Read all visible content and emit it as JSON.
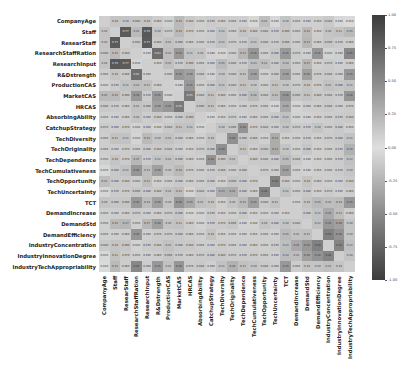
{
  "chart_data": {
    "type": "heatmap",
    "title": "",
    "xlabel": "",
    "ylabel": "",
    "labels": [
      "CompanyAge",
      "Staff",
      "ResearStaff",
      "ResearchStaffRation",
      "ResearchInput",
      "R&Dstrength",
      "ProductionCAS",
      "MarketCAS",
      "HRCAS",
      "AbsorbingAbility",
      "CatchupStrategy",
      "TechDiversity",
      "TechOriginality",
      "TechDependence",
      "TechCumulativeness",
      "TechOpportunity",
      "TechUncertainty",
      "TCT",
      "DemandIncrease",
      "DemandStd",
      "DemandEfficiency",
      "IndustryConcentration",
      "IndustryInnovationDegree",
      "IndustryTechAppropriability"
    ],
    "row_labels": [
      "CompanyAge",
      "Staff",
      "ResearStaff",
      "ResearchStaffRation",
      "ResearchInput",
      "R&Dstrength",
      "ProductionCAS",
      "MarketCAS",
      "HRCAS",
      "AbsorbingAbility",
      "CatchupStrategy",
      "TechDiversity",
      "TechOriginality",
      "TechDependence",
      "TechCumulativeness",
      "TechOpportunity",
      "TechUncertainty",
      "TCT",
      "DemandIncrease",
      "DemandStd",
      "DemandEfficiency",
      "IndustryConcentration",
      "IndustryInnovationDegree",
      "IndustryTechAppropriability"
    ],
    "col_labels": [
      "CompanyAge",
      "Staff",
      "ResearStaff",
      "ResearchStaffRation",
      "ResearchInput",
      "R&Dstrength",
      "ProductionCAS",
      "MarketCAS",
      "HRCAS",
      "AbsorbingAbility",
      "CatchupStrategy",
      "TechDiversity",
      "TechOriginality",
      "TechDependence",
      "TechCumulativeness",
      "TechOpportunity",
      "TechUncertainty",
      "TCT",
      "DemandIncrease",
      "DemandStd",
      "DemandEfficiency",
      "IndustryConcentration",
      "IndustryInnovationDegree",
      "IndustryTechAppropriability"
    ],
    "colorbar": {
      "min": -1.0,
      "max": 1.0,
      "ticks": [
        "1.00",
        "0.75",
        "0.50",
        "0.25",
        "0.00",
        "-0.25",
        "-0.50",
        "-0.75",
        "-1.00"
      ]
    },
    "annotated": true,
    "diagonal_masked": true,
    "values": [
      [
        1.0,
        0.1,
        0.1,
        0.09,
        0.1,
        0.06,
        0.04,
        0.15,
        0.08,
        0.05,
        0.07,
        0.06,
        0.06,
        0.05,
        0.02,
        0.13,
        0.02,
        0.1,
        0.05,
        0.05,
        0.05,
        0.08,
        0.02,
        0.01
      ],
      [
        0.1,
        1.0,
        0.77,
        0.15,
        0.79,
        0.1,
        0.07,
        0.15,
        0.07,
        0.05,
        0.06,
        0.11,
        0.06,
        0.1,
        0.08,
        0.08,
        0.07,
        0.09,
        0.06,
        0.15,
        0.05,
        0.1,
        0.11,
        0.15
      ],
      [
        0.1,
        0.77,
        1.0,
        0.08,
        0.77,
        0.08,
        0.11,
        0.09,
        0.06,
        0.06,
        0.07,
        0.11,
        0.07,
        0.07,
        0.11,
        0.08,
        0.07,
        0.09,
        0.06,
        0.17,
        0.06,
        0.09,
        0.07,
        0.06
      ],
      [
        0.09,
        0.15,
        0.08,
        1.0,
        0.03,
        0.63,
        0.13,
        0.35,
        0.11,
        0.1,
        0.04,
        0.03,
        0.06,
        0.17,
        0.36,
        0.06,
        0.09,
        0.35,
        0.07,
        0.05,
        0.36,
        0.04,
        0.05,
        0.45
      ],
      [
        0.1,
        0.79,
        0.77,
        0.03,
        1.0,
        0.05,
        0.12,
        0.07,
        0.09,
        0.06,
        0.06,
        0.15,
        0.08,
        0.07,
        0.13,
        0.13,
        0.08,
        0.14,
        0.06,
        0.17,
        0.05,
        0.07,
        0.05,
        0.06
      ],
      [
        0.06,
        0.1,
        0.08,
        0.63,
        0.05,
        1.0,
        0.06,
        0.35,
        0.3,
        0.08,
        0.04,
        0.1,
        0.08,
        0.11,
        0.3,
        0.05,
        0.08,
        0.3,
        0.06,
        0.3,
        0.07,
        0.08,
        0.06,
        0.35
      ],
      [
        0.04,
        0.07,
        0.11,
        0.13,
        0.12,
        0.06,
        1.0,
        0.04,
        0.35,
        0.05,
        0.08,
        0.11,
        0.08,
        0.11,
        0.1,
        0.06,
        0.11,
        0.1,
        0.07,
        0.1,
        0.07,
        0.11,
        0.09,
        0.11
      ],
      [
        0.15,
        0.15,
        0.09,
        0.35,
        0.07,
        0.35,
        0.04,
        1.0,
        0.55,
        0.08,
        0.11,
        0.08,
        0.06,
        0.09,
        0.16,
        0.08,
        0.13,
        0.36,
        0.09,
        0.11,
        0.08,
        0.08,
        0.07,
        0.36
      ],
      [
        0.08,
        0.07,
        0.06,
        0.11,
        0.09,
        0.3,
        0.35,
        0.55,
        1.0,
        0.09,
        0.11,
        0.06,
        0.05,
        0.06,
        0.07,
        0.06,
        0.03,
        0.25,
        0.03,
        0.06,
        0.06,
        0.08,
        0.06,
        0.07
      ],
      [
        0.05,
        0.05,
        0.06,
        0.1,
        0.06,
        0.08,
        0.05,
        0.08,
        0.09,
        1.0,
        0.03,
        0.05,
        0.07,
        0.05,
        0.06,
        0.06,
        0.08,
        0.12,
        0.04,
        0.04,
        0.05,
        0.06,
        0.07,
        0.08
      ],
      [
        0.07,
        0.06,
        0.07,
        0.04,
        0.06,
        0.04,
        0.08,
        0.11,
        0.11,
        0.03,
        1.0,
        0.1,
        0.09,
        0.38,
        0.07,
        0.08,
        0.06,
        0.1,
        0.07,
        0.07,
        0.1,
        0.06,
        0.08,
        0.05
      ],
      [
        0.06,
        0.11,
        0.11,
        0.03,
        0.15,
        0.1,
        0.11,
        0.08,
        0.06,
        0.05,
        0.1,
        1.0,
        0.4,
        0.09,
        0.08,
        0.05,
        0.23,
        0.05,
        0.05,
        0.07,
        0.05,
        0.07,
        0.08,
        0.11
      ],
      [
        0.06,
        0.06,
        0.07,
        0.06,
        0.08,
        0.08,
        0.08,
        0.06,
        0.05,
        0.07,
        0.09,
        0.4,
        1.0,
        0.11,
        0.06,
        0.09,
        0.23,
        0.1,
        0.05,
        0.09,
        0.05,
        0.06,
        0.07,
        0.2
      ],
      [
        0.05,
        0.1,
        0.07,
        0.17,
        0.07,
        0.11,
        0.11,
        0.09,
        0.06,
        0.05,
        0.38,
        0.09,
        0.11,
        1.0,
        0.08,
        0.08,
        0.08,
        0.15,
        0.08,
        0.04,
        0.05,
        0.06,
        0.07,
        0.12
      ],
      [
        0.02,
        0.08,
        0.11,
        0.36,
        0.13,
        0.3,
        0.1,
        0.16,
        0.07,
        0.06,
        0.07,
        0.08,
        0.06,
        0.08,
        1.0,
        0.07,
        0.06,
        0.31,
        0.05,
        0.04,
        0.05,
        0.06,
        0.07,
        0.1
      ],
      [
        0.13,
        0.08,
        0.08,
        0.06,
        0.13,
        0.05,
        0.06,
        0.08,
        0.06,
        0.06,
        0.08,
        0.05,
        0.09,
        0.08,
        0.07,
        1.0,
        0.49,
        0.08,
        0.05,
        0.1,
        0.06,
        0.05,
        0.06,
        0.08
      ],
      [
        0.02,
        0.07,
        0.07,
        0.09,
        0.08,
        0.08,
        0.11,
        0.13,
        0.03,
        0.08,
        0.06,
        0.23,
        0.23,
        0.08,
        0.06,
        0.49,
        1.0,
        0.11,
        0.06,
        0.08,
        0.05,
        0.07,
        0.05,
        0.06
      ],
      [
        0.1,
        0.09,
        0.09,
        0.35,
        0.14,
        0.3,
        0.1,
        0.36,
        0.25,
        0.12,
        0.1,
        0.05,
        0.1,
        0.15,
        0.31,
        0.08,
        0.11,
        1.0,
        0.05,
        0.1,
        0.15,
        0.13,
        0.14,
        0.35
      ],
      [
        0.05,
        0.06,
        0.06,
        0.07,
        0.06,
        0.06,
        0.07,
        0.09,
        0.03,
        0.04,
        0.07,
        0.05,
        0.05,
        0.08,
        0.05,
        0.05,
        0.06,
        0.05,
        1.0,
        0.08,
        0.11,
        0.25,
        0.13,
        0.06
      ],
      [
        0.05,
        0.15,
        0.17,
        0.05,
        0.17,
        0.3,
        0.1,
        0.11,
        0.06,
        0.04,
        0.07,
        0.07,
        0.09,
        0.04,
        0.04,
        0.1,
        0.08,
        0.1,
        0.08,
        1.0,
        0.12,
        0.35,
        0.3,
        0.1
      ],
      [
        0.05,
        0.05,
        0.06,
        0.36,
        0.05,
        0.07,
        0.07,
        0.08,
        0.06,
        0.05,
        0.1,
        0.05,
        0.05,
        0.05,
        0.05,
        0.06,
        0.05,
        0.15,
        0.11,
        0.12,
        1.0,
        0.5,
        0.38,
        0.1
      ],
      [
        0.08,
        0.1,
        0.09,
        0.04,
        0.07,
        0.08,
        0.11,
        0.08,
        0.08,
        0.06,
        0.06,
        0.07,
        0.06,
        0.06,
        0.06,
        0.05,
        0.07,
        0.13,
        0.25,
        0.35,
        0.5,
        1.0,
        0.48,
        0.12
      ],
      [
        0.02,
        0.11,
        0.07,
        0.05,
        0.05,
        0.06,
        0.09,
        0.07,
        0.06,
        0.07,
        0.08,
        0.08,
        0.07,
        0.07,
        0.07,
        0.06,
        0.05,
        0.14,
        0.13,
        0.3,
        0.38,
        0.48,
        1.0,
        0.1
      ],
      [
        0.01,
        0.15,
        0.06,
        0.45,
        0.06,
        0.35,
        0.11,
        0.36,
        0.07,
        0.08,
        0.05,
        0.11,
        0.2,
        0.12,
        0.1,
        0.08,
        0.06,
        0.35,
        0.06,
        0.1,
        0.1,
        0.12,
        0.1,
        1.0
      ]
    ]
  }
}
